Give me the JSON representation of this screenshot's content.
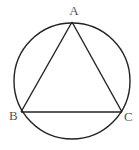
{
  "diagram": {
    "type": "inscribed-triangle",
    "circle": {
      "cx": 72,
      "cy": 81,
      "r": 58
    },
    "points": {
      "A": {
        "label": "A",
        "x": 72,
        "y": 22,
        "lx": 74,
        "ly": 15
      },
      "B": {
        "label": "B",
        "x": 21,
        "y": 112,
        "lx": 9,
        "ly": 120
      },
      "C": {
        "label": "C",
        "x": 122,
        "y": 112,
        "lx": 124,
        "ly": 121
      }
    },
    "segments": [
      [
        "A",
        "B"
      ],
      [
        "B",
        "C"
      ],
      [
        "C",
        "A"
      ]
    ],
    "stroke_color": "#222222"
  }
}
